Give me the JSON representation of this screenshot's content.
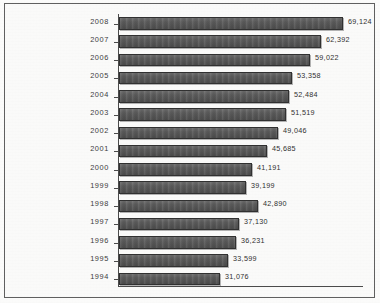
{
  "chart_data": {
    "type": "bar",
    "orientation": "horizontal",
    "title": "",
    "subtitle": "",
    "xlabel": "",
    "ylabel": "",
    "grid": false,
    "legend": null,
    "legend_position": "none",
    "xlim": [
      0,
      75000
    ],
    "categories": [
      "2008",
      "2007",
      "2006",
      "2005",
      "2004",
      "2003",
      "2002",
      "2001",
      "2000",
      "1999",
      "1998",
      "1997",
      "1996",
      "1995",
      "1994"
    ],
    "values": [
      69124,
      62392,
      59022,
      53358,
      52484,
      51519,
      49046,
      45685,
      41191,
      39199,
      42890,
      37130,
      36231,
      33599,
      31076
    ],
    "value_labels": [
      "69,124",
      "62,392",
      "59,022",
      "53,358",
      "52,484",
      "51,519",
      "49,046",
      "45,685",
      "41,191",
      "39,199",
      "42,890",
      "37,130",
      "36,231",
      "33,599",
      "31,076"
    ],
    "bar_color": "#5a5a5a",
    "bar_border_color": "#2f2f2f",
    "axis_color": "#4a4a4a",
    "frame_color": "#5f5f5f",
    "background_color": "#fcfcfb",
    "text_color": "#3b3b3b"
  },
  "rows": [
    {
      "category": "2008",
      "value": 69124,
      "label": "69,124"
    },
    {
      "category": "2007",
      "value": 62392,
      "label": "62,392"
    },
    {
      "category": "2006",
      "value": 59022,
      "label": "59,022"
    },
    {
      "category": "2005",
      "value": 53358,
      "label": "53,358"
    },
    {
      "category": "2004",
      "value": 52484,
      "label": "52,484"
    },
    {
      "category": "2003",
      "value": 51519,
      "label": "51,519"
    },
    {
      "category": "2002",
      "value": 49046,
      "label": "49,046"
    },
    {
      "category": "2001",
      "value": 45685,
      "label": "45,685"
    },
    {
      "category": "2000",
      "value": 41191,
      "label": "41,191"
    },
    {
      "category": "1999",
      "value": 39199,
      "label": "39,199"
    },
    {
      "category": "1998",
      "value": 42890,
      "label": "42,890"
    },
    {
      "category": "1997",
      "value": 37130,
      "label": "37,130"
    },
    {
      "category": "1996",
      "value": 36231,
      "label": "36,231"
    },
    {
      "category": "1995",
      "value": 33599,
      "label": "33,599"
    },
    {
      "category": "1994",
      "value": 31076,
      "label": "31,076"
    }
  ]
}
